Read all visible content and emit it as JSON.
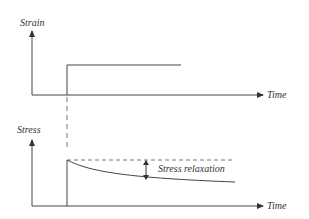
{
  "diagram": {
    "title": "",
    "top_plot": {
      "y_label": "Strain",
      "x_label": "Time",
      "curve": "step input of strain"
    },
    "bottom_plot": {
      "y_label": "Stress",
      "x_label": "Time",
      "annotation": "Stress relaxation",
      "curve": "stress decays after initial jump"
    },
    "colors": {
      "line": "#444444",
      "text": "#333333"
    }
  }
}
